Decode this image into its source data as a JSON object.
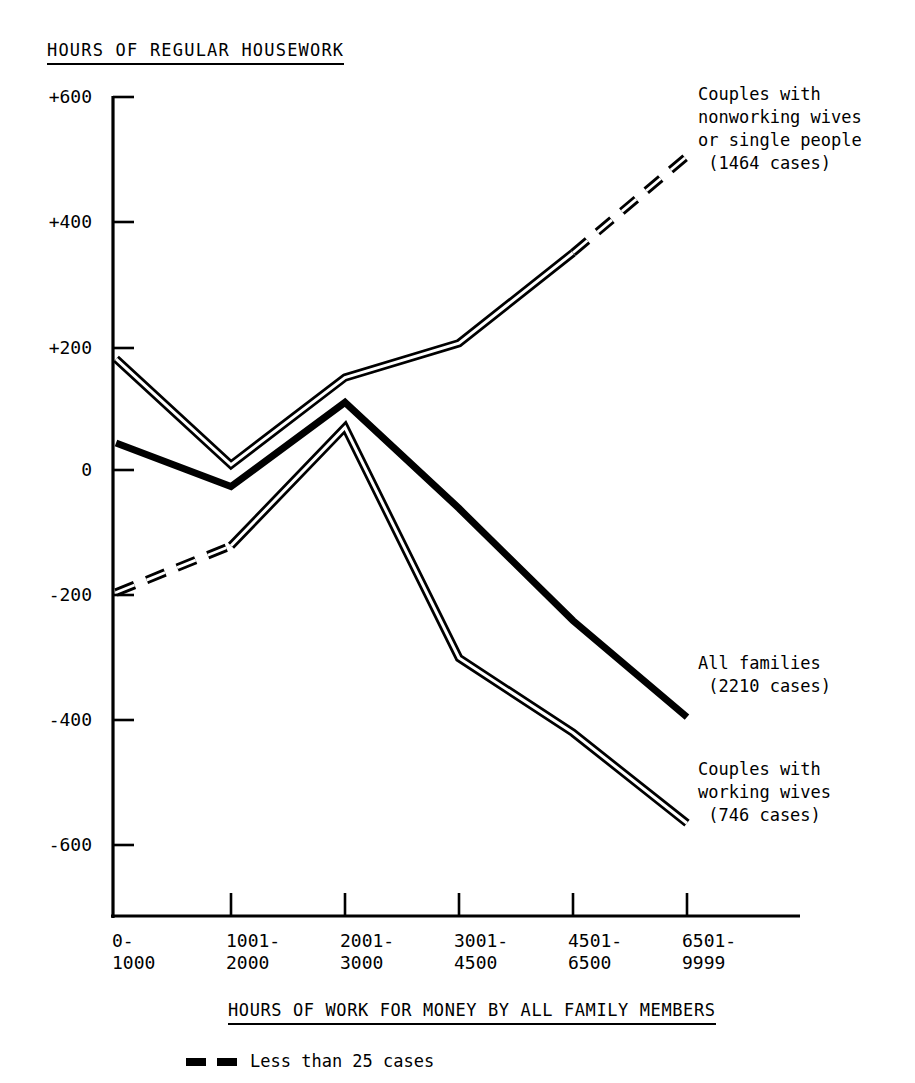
{
  "chart_data": {
    "type": "line",
    "title": "HOURS OF REGULAR HOUSEWORK",
    "xlabel": "HOURS OF WORK FOR MONEY BY ALL FAMILY MEMBERS",
    "ylabel": "",
    "categories": [
      "0-\n1000",
      "1001-\n2000",
      "2001-\n3000",
      "3001-\n4500",
      "4501-\n6500",
      "6501-\n9999"
    ],
    "category_values": [
      "0-1000",
      "1001-2000",
      "2001-3000",
      "3001-4500",
      "4501-6500",
      "6501-9999"
    ],
    "yticks": [
      "+600",
      "+400",
      "+200",
      "0",
      "-200",
      "-400",
      "-600"
    ],
    "ytick_values": [
      600,
      400,
      200,
      0,
      -200,
      -400,
      -600
    ],
    "ylim": [
      -700,
      620
    ],
    "grid": false,
    "legend_position": "right-inline",
    "series": [
      {
        "name": "Couples with nonworking wives or single people",
        "label": "Couples with\nnonworking wives\nor single people\n (1464 cases)",
        "cases": 1464,
        "style": "double",
        "values": [
          180,
          10,
          150,
          205,
          350,
          505
        ],
        "dashed_from_index": 4
      },
      {
        "name": "All families",
        "label": "All families\n (2210 cases)",
        "cases": 2210,
        "style": "solid",
        "values": [
          45,
          -25,
          110,
          -60,
          -240,
          -395
        ],
        "dashed_from_index": null
      },
      {
        "name": "Couples with working wives",
        "label": "Couples with\nworking wives\n (746 cases)",
        "cases": 746,
        "style": "double",
        "values": [
          -195,
          -120,
          70,
          -300,
          -420,
          -565
        ],
        "dashed_to_index": 2
      }
    ],
    "footnote": {
      "marker": "dashed-line",
      "text": "Less than 25 cases"
    },
    "colors": {
      "line": "#000000",
      "axis": "#000000",
      "background": "#ffffff"
    }
  }
}
